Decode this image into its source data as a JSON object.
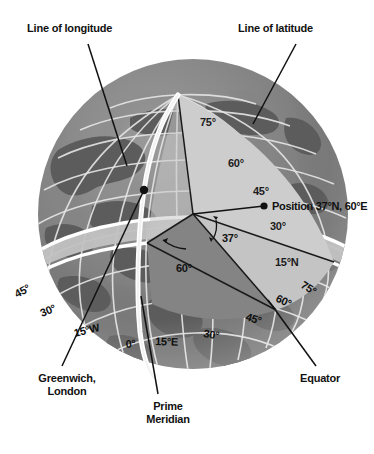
{
  "figure": {
    "background_color": "#ffffff"
  },
  "colors": {
    "ocean_dark": "#7c7c7c",
    "land_dark": "#5d5d5d",
    "wedge_light": "#c9c9c9",
    "wedge_mid": "#b3b3b3",
    "wedge_dark": "#8a8a8a",
    "equator_band": "#bdbdbd",
    "graticule": "#e8e8e8",
    "white_line": "#ffffff",
    "leader_line": "#111111",
    "text": "#111111"
  },
  "callouts": [
    {
      "id": "line-of-longitude",
      "label": "Line of longitude",
      "x": 27,
      "y": 22
    },
    {
      "id": "line-of-latitude",
      "label": "Line of latitude",
      "x": 238,
      "y": 22
    },
    {
      "id": "greenwich-london",
      "label_line1": "Greenwich,",
      "label_line2": "London",
      "x": 12,
      "y": 372
    },
    {
      "id": "prime-meridian",
      "label_line1": "Prime",
      "label_line2": "Meridian",
      "x": 139,
      "y": 404
    },
    {
      "id": "equator",
      "label": "Equator",
      "x": 300,
      "y": 372
    }
  ],
  "position_marker": {
    "label": "Position 37°N, 60°E",
    "latitude": 37,
    "latitude_hemisphere": "N",
    "longitude": 60,
    "longitude_hemisphere": "E",
    "dot_x": 264,
    "dot_y": 206
  },
  "angles": [
    {
      "id": "latitude-angle",
      "label": "37°",
      "value": 37,
      "x": 229,
      "y": 238
    },
    {
      "id": "longitude-angle",
      "label": "60°",
      "value": 60,
      "x": 186,
      "y": 268
    }
  ],
  "latitude_labels": [
    {
      "label": "75°",
      "value": 75,
      "x": 212,
      "y": 122
    },
    {
      "label": "60°",
      "value": 60,
      "x": 240,
      "y": 163
    },
    {
      "label": "45°",
      "value": 45,
      "x": 265,
      "y": 191
    },
    {
      "label": "30°",
      "value": 30,
      "x": 282,
      "y": 226
    },
    {
      "label": "15°N",
      "value": 15,
      "x": 289,
      "y": 262
    }
  ],
  "longitude_labels": [
    {
      "label": "45°",
      "value": 45,
      "hemisphere": "W",
      "x": 29,
      "y": 294
    },
    {
      "label": "30°",
      "value": 30,
      "hemisphere": "W",
      "x": 54,
      "y": 313
    },
    {
      "label": "15°W",
      "value": 15,
      "hemisphere": "W",
      "x": 92,
      "y": 333
    },
    {
      "label": "0°",
      "value": 0,
      "hemisphere": "",
      "x": 133,
      "y": 344
    },
    {
      "label": "15°E",
      "value": 15,
      "hemisphere": "E",
      "x": 168,
      "y": 341
    },
    {
      "label": "30°",
      "value": 30,
      "hemisphere": "E",
      "x": 215,
      "y": 333
    },
    {
      "label": "45°",
      "value": 45,
      "hemisphere": "E",
      "x": 255,
      "y": 315
    },
    {
      "label": "60°",
      "value": 60,
      "hemisphere": "E",
      "x": 285,
      "y": 296
    },
    {
      "label": "75°",
      "value": 75,
      "hemisphere": "E",
      "x": 310,
      "y": 282
    }
  ],
  "globe": {
    "center_x": 193,
    "center_y": 214,
    "radius": 155,
    "north_pole_x": 178,
    "north_pole_y": 95
  }
}
